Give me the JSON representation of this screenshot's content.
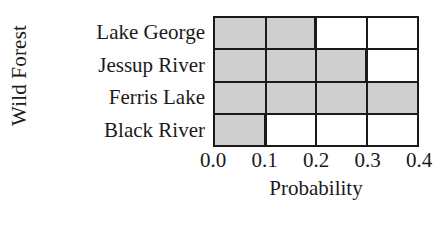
{
  "chart_data": {
    "type": "bar",
    "orientation": "horizontal",
    "title": "",
    "xlabel": "Probability",
    "ylabel": "Wild Forest",
    "categories": [
      "Lake George",
      "Jessup River",
      "Ferris Lake",
      "Black River"
    ],
    "values": [
      0.2,
      0.3,
      0.4,
      0.1
    ],
    "xlim": [
      0.0,
      0.4
    ],
    "xticks": [
      0.0,
      0.1,
      0.2,
      0.3,
      0.4
    ],
    "xticklabels": [
      "0.0",
      "0.1",
      "0.2",
      "0.3",
      "0.4"
    ],
    "grid": true,
    "legend": null,
    "bar_color": "#cfcfcf",
    "edge_color": "#1a1a1a",
    "background": "#ffffff"
  },
  "axis": {
    "x_title": "Probability",
    "y_title": "Wild Forest"
  }
}
